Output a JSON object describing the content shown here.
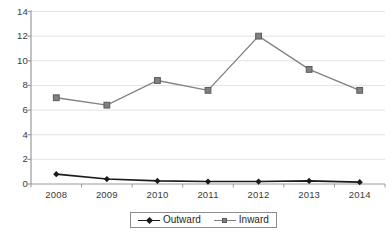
{
  "chart_data": {
    "type": "line",
    "title": "",
    "xlabel": "",
    "ylabel": "",
    "categories": [
      "2008",
      "2009",
      "2010",
      "2011",
      "2012",
      "2013",
      "2014"
    ],
    "x": [
      2008,
      2009,
      2010,
      2011,
      2012,
      2013,
      2014
    ],
    "ylim": [
      0,
      14
    ],
    "yticks": [
      0,
      2,
      4,
      6,
      8,
      10,
      12,
      14
    ],
    "ytick_labels": [
      "0",
      "2",
      "4",
      "6",
      "8",
      "10",
      "12",
      "14"
    ],
    "grid": "horizontal",
    "legend_position": "bottom-center",
    "series": [
      {
        "name": "Outward",
        "values": [
          0.8,
          0.4,
          0.25,
          0.2,
          0.2,
          0.25,
          0.15
        ],
        "color": "#1a1a1a",
        "marker": "diamond"
      },
      {
        "name": "Inward",
        "values": [
          7.0,
          6.4,
          8.4,
          7.6,
          12.0,
          9.3,
          7.6
        ],
        "color": "#808080",
        "marker": "square"
      }
    ]
  },
  "legend": {
    "items": [
      {
        "label": "Outward",
        "marker": "diamond-marker",
        "color": "#1a1a1a"
      },
      {
        "label": "Inward",
        "marker": "square-marker",
        "color": "#808080"
      }
    ]
  },
  "axes": {
    "y_tick_labels": [
      "14",
      "12",
      "10",
      "8",
      "6",
      "4",
      "2",
      "0"
    ],
    "x_tick_labels": [
      "2008",
      "2009",
      "2010",
      "2011",
      "2012",
      "2013",
      "2014"
    ]
  },
  "style": {
    "grid_color": "#e3e3e3",
    "axis_color": "#9a9a9a",
    "background": "#ffffff"
  }
}
